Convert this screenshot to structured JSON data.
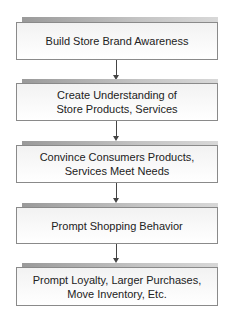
{
  "diagram": {
    "type": "flowchart",
    "direction": "top-to-bottom",
    "steps": [
      {
        "label": "Build Store Brand Awareness"
      },
      {
        "label": "Create Understanding of\nStore Products, Services"
      },
      {
        "label": "Convince Consumers Products,\nServices Meet Needs"
      },
      {
        "label": "Prompt Shopping Behavior"
      },
      {
        "label": "Prompt Loyalty, Larger Purchases,\nMove Inventory, Etc."
      }
    ],
    "connectors": [
      {
        "from": 0,
        "to": 1,
        "style": "arrow"
      },
      {
        "from": 1,
        "to": 2,
        "style": "arrow"
      },
      {
        "from": 2,
        "to": 3,
        "style": "arrow"
      },
      {
        "from": 3,
        "to": 4,
        "style": "arrow"
      }
    ],
    "colors": {
      "box_border": "#8a8a8a",
      "box_fill": "#f5f5f5",
      "shadow": "#a8a8a8",
      "arrow": "#444444",
      "text": "#222222"
    }
  }
}
